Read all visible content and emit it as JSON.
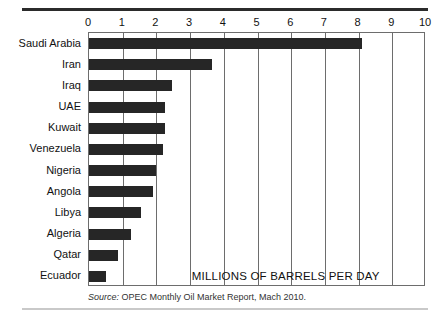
{
  "chart_data": {
    "type": "bar",
    "orientation": "horizontal",
    "title": "",
    "subtitle": "",
    "annotation": "MILLIONS OF BARRELS PER DAY",
    "xlabel": "",
    "ylabel": "",
    "xlim": [
      0,
      10
    ],
    "xticks": [
      "0",
      "1",
      "2",
      "3",
      "4",
      "5",
      "6",
      "7",
      "8",
      "9",
      "10"
    ],
    "grid": true,
    "grid_axis": "x",
    "legend": "none",
    "bar_color": "#262626",
    "categories": [
      "Saudi Arabia",
      "Iran",
      "Iraq",
      "UAE",
      "Kuwait",
      "Venezuela",
      "Nigeria",
      "Angola",
      "Libya",
      "Algeria",
      "Qatar",
      "Ecuador"
    ],
    "values": [
      8.1,
      3.65,
      2.45,
      2.25,
      2.25,
      2.2,
      2.0,
      1.9,
      1.55,
      1.25,
      0.85,
      0.5
    ]
  },
  "source_note": {
    "prefix": "Source:",
    "text": " OPEC Monthly Oil Market Report, Mach 2010."
  }
}
